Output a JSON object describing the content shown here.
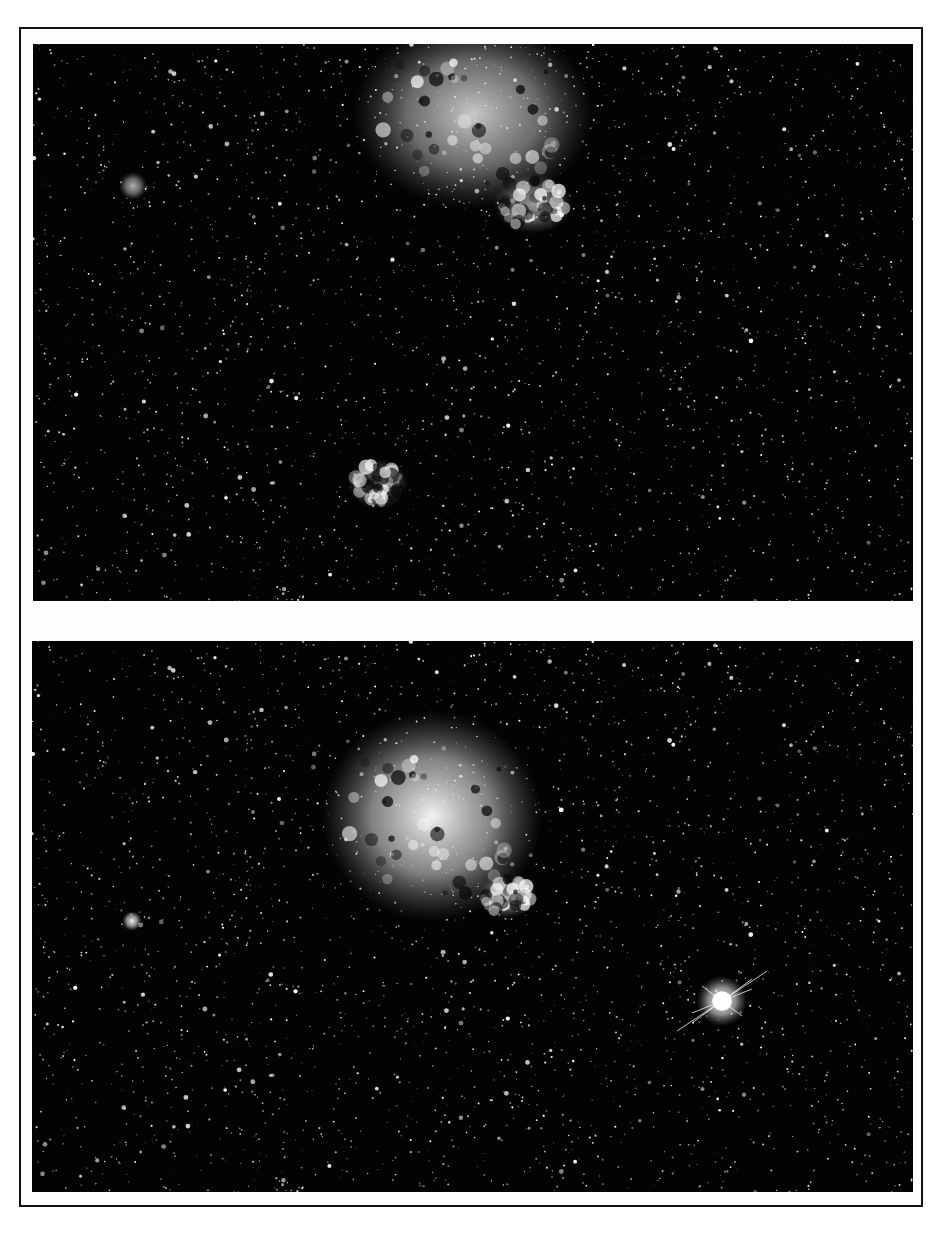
{
  "figure": {
    "panels": [
      {
        "id": "top",
        "description": "Star field with diffuse nebula at top-center (pre-event plate)",
        "features": [
          {
            "type": "nebula",
            "cx": 440,
            "cy": 70,
            "rx": 120,
            "ry": 95,
            "brightness": 0.78
          },
          {
            "type": "nebula",
            "cx": 500,
            "cy": 160,
            "rx": 40,
            "ry": 30,
            "brightness": 0.6
          },
          {
            "type": "nebula",
            "cx": 345,
            "cy": 440,
            "rx": 30,
            "ry": 25,
            "brightness": 0.6
          },
          {
            "type": "cluster",
            "cx": 100,
            "cy": 142,
            "r": 14,
            "brightness": 0.7
          }
        ]
      },
      {
        "id": "bottom",
        "description": "Same star field with brighter nebula and a bright point source with diffraction spikes at lower right (post-event plate)",
        "features": [
          {
            "type": "nebula",
            "cx": 400,
            "cy": 175,
            "rx": 110,
            "ry": 105,
            "brightness": 0.95
          },
          {
            "type": "nebula",
            "cx": 475,
            "cy": 255,
            "rx": 30,
            "ry": 22,
            "brightness": 0.75
          },
          {
            "type": "cluster",
            "cx": 100,
            "cy": 280,
            "r": 10,
            "brightness": 0.95
          },
          {
            "type": "bright-star",
            "cx": 690,
            "cy": 360,
            "r": 14,
            "brightness": 1.0
          }
        ]
      }
    ],
    "colors": {
      "sky": "#030303",
      "paper": "#fdfdfd",
      "border": "#111111"
    }
  }
}
